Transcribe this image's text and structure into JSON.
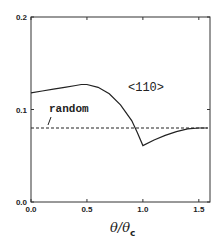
{
  "chart_data": {
    "type": "line",
    "title": "",
    "xlabel": "θ/θc",
    "ylabel": "",
    "xlim": [
      0.0,
      1.6
    ],
    "ylim": [
      0.0,
      0.2
    ],
    "x_ticks": [
      "0.0",
      "0.5",
      "1.0",
      "1.5"
    ],
    "y_ticks": [
      "0.0",
      "0.1",
      "0.2"
    ],
    "annotations": [
      "<110>",
      "random"
    ],
    "grid": false,
    "series": [
      {
        "name": "<110>",
        "style": "solid",
        "x": [
          0.0,
          0.1,
          0.2,
          0.3,
          0.4,
          0.45,
          0.5,
          0.6,
          0.7,
          0.8,
          0.9,
          0.95,
          1.0,
          1.1,
          1.2,
          1.3,
          1.4,
          1.5,
          1.58
        ],
        "y": [
          0.118,
          0.12,
          0.122,
          0.124,
          0.126,
          0.127,
          0.127,
          0.124,
          0.117,
          0.105,
          0.088,
          0.075,
          0.061,
          0.067,
          0.072,
          0.076,
          0.079,
          0.08,
          0.08
        ]
      },
      {
        "name": "random",
        "style": "dashed",
        "x": [
          0.0,
          1.58
        ],
        "y": [
          0.08,
          0.08
        ]
      }
    ]
  },
  "labels": {
    "annotation_110": "<110>",
    "annotation_random": "random",
    "xlabel_theta": "θ/θ",
    "xlabel_sub": "c"
  }
}
